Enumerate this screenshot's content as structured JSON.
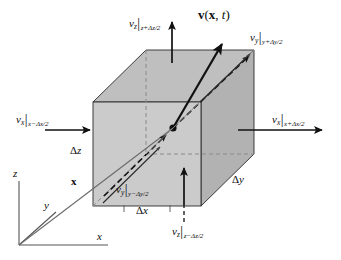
{
  "figure": {
    "type": "diagram",
    "background_color": "#ffffff",
    "line_color": "#1a1a1a",
    "face_colors": {
      "front": "#c9c9c9",
      "top": "#bdbdbd",
      "right": "#b3b3b3"
    }
  },
  "velocity_field": {
    "symbol": "v",
    "args_open": "(",
    "position": "x",
    "comma": ", ",
    "time": "t",
    "args_close": ")",
    "full_text": "v(x, t)"
  },
  "face_labels": [
    {
      "id": "v-z-top",
      "component": "v",
      "component_sub": "z",
      "bar": "|",
      "condition": "z+Δz/2",
      "full_text": "v_z|_{z+Δz/2}",
      "face": "top"
    },
    {
      "id": "v-y-back",
      "component": "v",
      "component_sub": "y",
      "bar": "|",
      "condition": "y+Δy/2",
      "full_text": "v_y|_{y+Δy/2}",
      "face": "back"
    },
    {
      "id": "v-x-left",
      "component": "v",
      "component_sub": "x",
      "bar": "|",
      "condition": "x−Δx/2",
      "full_text": "v_x|_{x−Δx/2}",
      "face": "left"
    },
    {
      "id": "v-x-right",
      "component": "v",
      "component_sub": "x",
      "bar": "|",
      "condition": "x+Δx/2",
      "full_text": "v_x|_{x+Δx/2}",
      "face": "right"
    },
    {
      "id": "v-y-front",
      "component": "v",
      "component_sub": "y",
      "bar": "|",
      "condition": "y−Δy/2",
      "full_text": "v_y|_{y−Δy/2}",
      "face": "front"
    },
    {
      "id": "v-z-bottom",
      "component": "v",
      "component_sub": "z",
      "bar": "|",
      "condition": "z−Δz/2",
      "full_text": "v_z|_{z−Δz/2}",
      "face": "bottom"
    }
  ],
  "dimension_labels": [
    {
      "id": "delta-z",
      "delta": "Δ",
      "axis": "z",
      "full_text": "Δz"
    },
    {
      "id": "delta-x",
      "delta": "Δ",
      "axis": "x",
      "full_text": "Δx"
    },
    {
      "id": "delta-y",
      "delta": "Δ",
      "axis": "y",
      "full_text": "Δy"
    }
  ],
  "axes": [
    {
      "id": "axis-z",
      "label": "z"
    },
    {
      "id": "axis-y",
      "label": "y"
    },
    {
      "id": "axis-x",
      "label": "x"
    }
  ],
  "position_vector": {
    "id": "position-vector",
    "label": "x"
  }
}
